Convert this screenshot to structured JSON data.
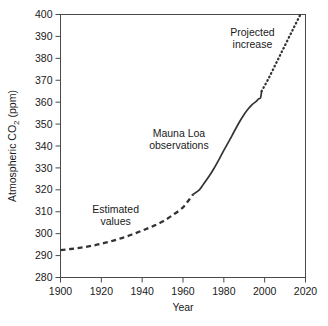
{
  "chart_data": {
    "type": "line",
    "title": "",
    "xlabel": "Year",
    "ylabel": "Atmospheric CO2 (ppm)",
    "ylabel_parts": {
      "lead": "Atmospheric CO",
      "subscript": "2",
      "trail": " (ppm)"
    },
    "xlim": [
      1900,
      2020
    ],
    "ylim": [
      280,
      400
    ],
    "xticks": [
      1900,
      1920,
      1940,
      1960,
      1980,
      2000,
      2020
    ],
    "xtick_labels": [
      "1900",
      "1920",
      "1940",
      "1960",
      "1980",
      "2000",
      "2020"
    ],
    "yticks": [
      280,
      290,
      300,
      310,
      320,
      330,
      340,
      350,
      360,
      370,
      380,
      390,
      400
    ],
    "ytick_labels": [
      "280",
      "290",
      "300",
      "310",
      "320",
      "330",
      "340",
      "350",
      "360",
      "370",
      "380",
      "390",
      "400"
    ],
    "grid": false,
    "legend": "none",
    "line_color": "#333333",
    "series": [
      {
        "name": "Estimated values",
        "style": "dashed",
        "points": [
          [
            1900,
            292.5
          ],
          [
            1905,
            293.0
          ],
          [
            1910,
            293.6
          ],
          [
            1915,
            294.4
          ],
          [
            1920,
            295.4
          ],
          [
            1925,
            296.6
          ],
          [
            1930,
            298.0
          ],
          [
            1935,
            299.6
          ],
          [
            1940,
            301.4
          ],
          [
            1945,
            303.3
          ],
          [
            1950,
            305.5
          ],
          [
            1955,
            308.5
          ],
          [
            1960,
            312.0
          ],
          [
            1963,
            315.5
          ],
          [
            1965,
            318.0
          ]
        ]
      },
      {
        "name": "Mauna Loa observations",
        "style": "solid",
        "points": [
          [
            1965,
            318.0
          ],
          [
            1968,
            320.0
          ],
          [
            1970,
            322.5
          ],
          [
            1973,
            326.5
          ],
          [
            1975,
            329.5
          ],
          [
            1978,
            334.5
          ],
          [
            1980,
            338.0
          ],
          [
            1983,
            343.0
          ],
          [
            1985,
            346.5
          ],
          [
            1988,
            351.5
          ],
          [
            1990,
            354.5
          ],
          [
            1992,
            357.0
          ],
          [
            1994,
            359.0
          ],
          [
            1996,
            360.5
          ],
          [
            1997,
            361.5
          ],
          [
            1998,
            362.0
          ],
          [
            1998.5,
            365.0
          ]
        ]
      },
      {
        "name": "Projected increase",
        "style": "dotted",
        "points": [
          [
            1998.5,
            365.0
          ],
          [
            2002,
            371.0
          ],
          [
            2006,
            378.5
          ],
          [
            2010,
            386.0
          ],
          [
            2014,
            393.5
          ],
          [
            2017.5,
            400.0
          ]
        ]
      }
    ],
    "annotations": [
      {
        "name": "estimated-values",
        "lines": [
          "Estimated",
          "values"
        ],
        "x": 1927,
        "y": 309.5
      },
      {
        "name": "mauna-loa-observations",
        "lines": [
          "Mauna Loa",
          "observations"
        ],
        "x": 1958,
        "y": 344.0
      },
      {
        "name": "projected-increase",
        "lines": [
          "Projected",
          "increase"
        ],
        "x": 1994,
        "y": 390.0
      }
    ]
  }
}
